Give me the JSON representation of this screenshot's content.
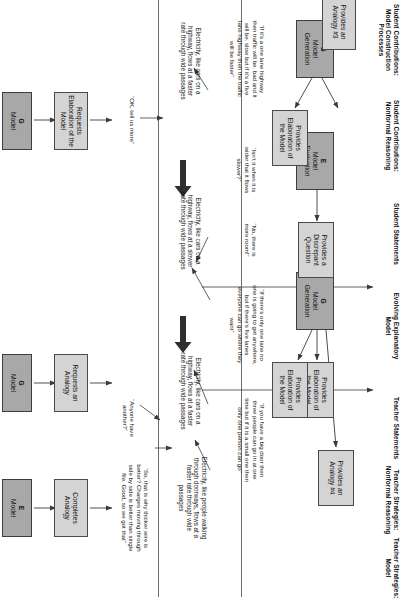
{
  "diagram": {
    "columns": [
      {
        "id": "student-model-construction",
        "label": "Student Contributions: Model Construction Processes"
      },
      {
        "id": "student-nonformal-reasoning",
        "label": "Student Contributions: Nonformal Reasoning"
      },
      {
        "id": "student-statements",
        "label": "Student Statements"
      },
      {
        "id": "evolving-explanatory-model",
        "label": "Evolving Explanatory Model"
      },
      {
        "id": "teacher-statements",
        "label": "Teacher Statements"
      },
      {
        "id": "teacher-nonformal-reasoning",
        "label": "Teacher Strategies: Nonformal Reasoning"
      },
      {
        "id": "teacher-model",
        "label": "Teacher Strategies: Model"
      }
    ],
    "student_process_nodes": [
      {
        "id": "g-model-generation-1",
        "code": "G",
        "line1": "Model",
        "line2": "Generation",
        "shade": "dark"
      },
      {
        "id": "e-model-evaluation",
        "code": "E",
        "line1": "Model",
        "line2": "Evaluation",
        "shade": "dark"
      },
      {
        "id": "g-model-generation-2",
        "code": "G",
        "line1": "Model",
        "line2": "Generation",
        "shade": "dark"
      }
    ],
    "student_reasoning_nodes": [
      {
        "id": "provides-analogy-3",
        "label": "Provides an Analogy #3",
        "shade": "light"
      },
      {
        "id": "provides-elaboration-1",
        "label": "Provides Elaboration of the Model",
        "shade": "light"
      },
      {
        "id": "provides-discrepant-question",
        "label": "Provides a Discrepant Question",
        "shade": "light"
      },
      {
        "id": "provides-elaboration-2",
        "label": "Provides Elaboration of the Model",
        "shade": "light"
      },
      {
        "id": "provides-elaboration-3",
        "label": "Provides Elaboration of the Model",
        "shade": "light"
      },
      {
        "id": "provides-analogy-4",
        "label": "Provides an Analogy #4",
        "shade": "light"
      }
    ],
    "student_statements": [
      {
        "id": "stmt-one-lane-highway",
        "text": "“If it's a one lane highway then traffic will be. bad and it will be. slow but if it's a five lane highway then the traffic will be faster”"
      },
      {
        "id": "stmt-wider-slower",
        "text": "“Isn't it when it is wider that it flows slower?”"
      },
      {
        "id": "stmt-no-more-room",
        "text": "“No, there is more room!”"
      },
      {
        "id": "stmt-one-lane-anywhere",
        "text": "“If there's only one lane no one is going to get anywhere, but if there's five lanes everyone can go where they want”"
      },
      {
        "id": "stmt-big-door",
        "text": "“If you have a big door then three people can go in at one time but if it is a small one then only one person can go”"
      }
    ],
    "evolving_model_states": [
      {
        "id": "model-faster-wide",
        "text": "Electricity, like cars on a highway, flows at a faster rate through wide passages"
      },
      {
        "id": "model-slower-wide",
        "text": "Electricity, like cars on a highway, flows at a slower rate through wide passages"
      },
      {
        "id": "model-faster-wide-2",
        "text": "Electricity, like cars on a highway, flows at a faster rate through wide passages"
      },
      {
        "id": "model-people-doorways",
        "text": "Electricity, like people walking through doorways, flows at a faster rate through wide passages"
      }
    ],
    "teacher_statements": [
      {
        "id": "teach-ok-tell-us-more",
        "text": "“OK, tell us more”"
      },
      {
        "id": "teach-anyone-have-another",
        "text": "“Anyone have another?”"
      },
      {
        "id": "teach-thicker-wire",
        "text": "“So, that is why thicker wire is better? Charges moving through side by side is better than single file. Good, so we got that”"
      }
    ],
    "teacher_strategy_nodes": [
      {
        "id": "requests-elaboration",
        "label": "Requests Elaboration of the Model",
        "shade": "light"
      },
      {
        "id": "requests-analogy",
        "label": "Requests an Analogy",
        "shade": "light"
      },
      {
        "id": "completes-analogy",
        "label": "Completes Analogy",
        "shade": "light"
      }
    ],
    "teacher_model_nodes": [
      {
        "id": "teacher-g-model",
        "code": "G",
        "line1": "Model",
        "line2": "",
        "shade": "dark"
      },
      {
        "id": "teacher-g-model-2",
        "code": "G",
        "line1": "Model",
        "line2": "",
        "shade": "dark"
      },
      {
        "id": "teacher-e-model",
        "code": "E",
        "line1": "Model",
        "line2": "",
        "shade": "dark"
      }
    ],
    "colors": {
      "dark_box": "#a8a8a8",
      "light_box": "#d4d4d4",
      "line": "#4a4a4a",
      "text": "#111111",
      "background": "#ffffff"
    }
  }
}
